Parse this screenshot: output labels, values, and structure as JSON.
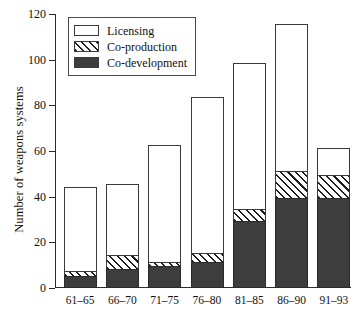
{
  "chart_data": {
    "type": "bar",
    "subtype": "stacked-bar",
    "title": "",
    "xlabel": "",
    "ylabel": "Number of weapons systems",
    "ylim": [
      0,
      120
    ],
    "ytick_values": [
      0,
      20,
      40,
      60,
      80,
      100,
      120
    ],
    "ytick_labels": [
      "0",
      "20",
      "40",
      "60",
      "80",
      "100",
      "120"
    ],
    "grid": false,
    "legend_position": "upper-left-inside",
    "categories": [
      "61–65",
      "66–70",
      "71–75",
      "76–80",
      "81–85",
      "86–90",
      "91–93"
    ],
    "series": [
      {
        "name": "Co-development",
        "pattern": "solid-dark",
        "color": "#3d3d3d",
        "values": [
          5,
          8,
          9,
          11,
          29,
          39,
          39
        ]
      },
      {
        "name": "Co-production",
        "pattern": "diagonal-hatch",
        "color": "#ffffff",
        "values": [
          2,
          6,
          2,
          4,
          5,
          12,
          10
        ]
      },
      {
        "name": "Licensing",
        "pattern": "white",
        "color": "#ffffff",
        "values": [
          37,
          31,
          51,
          68,
          64,
          64,
          12
        ]
      }
    ],
    "totals": [
      44,
      45,
      62,
      83,
      98,
      115,
      61
    ],
    "cumulative_tops": [
      {
        "codevelopment": 5,
        "coproduction": 7,
        "total": 44
      },
      {
        "codevelopment": 8,
        "coproduction": 14,
        "total": 45
      },
      {
        "codevelopment": 9,
        "coproduction": 11,
        "total": 62
      },
      {
        "codevelopment": 11,
        "coproduction": 15,
        "total": 83
      },
      {
        "codevelopment": 29,
        "coproduction": 34,
        "total": 98
      },
      {
        "codevelopment": 39,
        "coproduction": 51,
        "total": 115
      },
      {
        "codevelopment": 39,
        "coproduction": 49,
        "total": 61
      }
    ]
  },
  "legend": {
    "items": [
      {
        "label": "Licensing",
        "style": "white"
      },
      {
        "label": "Co-production",
        "style": "hatch"
      },
      {
        "label": "Co-development",
        "style": "dark"
      }
    ]
  }
}
